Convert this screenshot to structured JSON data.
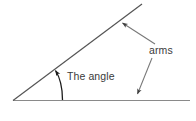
{
  "figure": {
    "width": 196,
    "height": 121,
    "background_color": "#ffffff"
  },
  "labels": {
    "angle": "The angle",
    "arms": "arms"
  },
  "colors": {
    "arm_line": "#8a8a8a",
    "diagonal_arm_line": "#555555",
    "leader_line": "#777777",
    "arc": "#1a1a1a",
    "text": "#3a3a3a"
  },
  "geometry": {
    "vertex": {
      "x": 13,
      "y": 100
    },
    "horizontal_arm": {
      "x1": 13,
      "y1": 100,
      "x2": 190,
      "y2": 100
    },
    "diagonal_arm": {
      "x1": 13,
      "y1": 100,
      "x2": 142,
      "y2": 4
    },
    "angle_arc": {
      "start_x": 62,
      "start_y": 100,
      "end_x": 55,
      "end_y": 70,
      "radius": 34
    },
    "leader_to_diagonal": {
      "x1": 155,
      "y1": 44,
      "x2": 121,
      "y2": 22
    },
    "leader_to_horizontal": {
      "x1": 152,
      "y1": 58,
      "x2": 137,
      "y2": 95
    }
  }
}
